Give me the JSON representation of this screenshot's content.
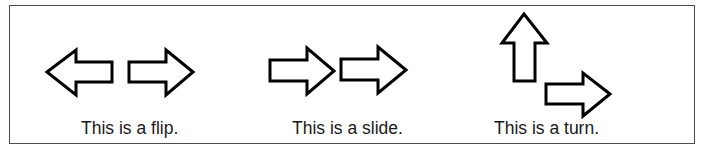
{
  "diagram": {
    "panels": [
      {
        "id": "flip",
        "caption": "This is a flip.",
        "arrows": [
          {
            "direction": "left"
          },
          {
            "direction": "right"
          }
        ]
      },
      {
        "id": "slide",
        "caption": "This is a slide.",
        "arrows": [
          {
            "direction": "right"
          },
          {
            "direction": "right"
          }
        ]
      },
      {
        "id": "turn",
        "caption": "This is a turn.",
        "arrows": [
          {
            "direction": "up"
          },
          {
            "direction": "right"
          }
        ]
      }
    ],
    "colors": {
      "stroke": "#000000",
      "fill": "#ffffff",
      "frame": "#4a4a4a",
      "text": "#1a1a1a"
    }
  }
}
